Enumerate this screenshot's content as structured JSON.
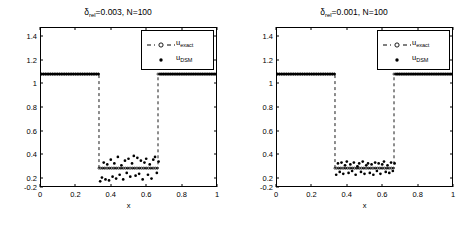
{
  "figure": {
    "background": "#ffffff",
    "axis_color": "#000000",
    "data_color": "#000000"
  },
  "panels": [
    {
      "id": "panel-left",
      "title_prefix": "δ",
      "title_sub": "rel",
      "title_rest": "=0.003, N=100",
      "title_full": "δrel=0.003, N=100"
    },
    {
      "id": "panel-right",
      "title_prefix": "δ",
      "title_sub": "rel",
      "title_rest": "=0.001, N=100",
      "title_full": "δrel=0.001, N=100"
    }
  ],
  "legend": {
    "entries": [
      {
        "label_main": "u",
        "label_sub": "exact",
        "style": "dashed-line-with-circle-marker"
      },
      {
        "label_main": "u",
        "label_sub": "DSM",
        "style": "dot-marker"
      }
    ]
  },
  "axis": {
    "xlabel": "x",
    "ylabel": "",
    "xticks": [
      "0",
      "0.2",
      "0.4",
      "0.6",
      "0.8",
      "1"
    ],
    "xtick_values": [
      0,
      0.2,
      0.4,
      0.6,
      0.8,
      1
    ],
    "yticks": [
      "-0.2",
      "0",
      "0.2",
      "0.4",
      "0.6",
      "0.8",
      "1",
      "1.2",
      "1.4"
    ],
    "ytick_values": [
      -0.2,
      0,
      0.2,
      0.4,
      0.6,
      0.8,
      1,
      1.2,
      1.4
    ],
    "xlim": [
      0,
      1
    ],
    "ylim": [
      -0.2,
      1.5
    ],
    "grid": false
  },
  "chart_data": {
    "type": "scatter",
    "xlabel": "x",
    "ylabel": "",
    "xlim": [
      0,
      1
    ],
    "ylim": [
      -0.2,
      1.5
    ],
    "grid": false,
    "legend_position": "upper right",
    "panels": [
      {
        "title": "δrel=0.003, N=100",
        "noise_level": 0.003,
        "N": 100,
        "series": [
          {
            "name": "u_exact",
            "style": "dashed line with circle markers",
            "description": "Piecewise-constant well: u=1 for x in [0,1/3) and (2/3,1]; u=0 for x in [1/3,2/3]; vertical dashed jumps at x=1/3 and x=2/3",
            "x": [
              0,
              0.3333,
              0.3333,
              0.6667,
              0.6667,
              1
            ],
            "y": [
              1,
              1,
              0,
              0,
              1,
              1
            ]
          },
          {
            "name": "u_DSM",
            "style": "dot markers",
            "description": "Reconstruction: matches 1 on outer intervals, noisy scatter about 0 on inner interval with spread roughly +/-0.15",
            "x": [
              0.01,
              0.02,
              0.03,
              0.04,
              0.05,
              0.06,
              0.07,
              0.08,
              0.09,
              0.1,
              0.11,
              0.12,
              0.13,
              0.14,
              0.15,
              0.16,
              0.17,
              0.18,
              0.19,
              0.2,
              0.21,
              0.22,
              0.23,
              0.24,
              0.25,
              0.26,
              0.27,
              0.28,
              0.29,
              0.3,
              0.31,
              0.32,
              0.33,
              0.34,
              0.35,
              0.36,
              0.37,
              0.38,
              0.39,
              0.4,
              0.41,
              0.42,
              0.43,
              0.44,
              0.45,
              0.46,
              0.47,
              0.48,
              0.49,
              0.5,
              0.51,
              0.52,
              0.53,
              0.54,
              0.55,
              0.56,
              0.57,
              0.58,
              0.59,
              0.6,
              0.61,
              0.62,
              0.63,
              0.64,
              0.65,
              0.66,
              0.67,
              0.68,
              0.69,
              0.7,
              0.71,
              0.72,
              0.73,
              0.74,
              0.75,
              0.76,
              0.77,
              0.78,
              0.79,
              0.8,
              0.81,
              0.82,
              0.83,
              0.84,
              0.85,
              0.86,
              0.87,
              0.88,
              0.89,
              0.9,
              0.91,
              0.92,
              0.93,
              0.94,
              0.95,
              0.96,
              0.97,
              0.98,
              0.99,
              1.0
            ],
            "y": [
              1,
              1,
              1,
              1,
              1,
              1,
              1,
              1,
              1,
              1,
              1,
              1,
              1,
              1,
              1,
              1,
              1,
              1,
              1,
              1,
              1,
              1,
              1,
              1,
              1,
              1,
              1,
              1,
              1,
              1,
              1,
              1,
              1,
              -0.14,
              -0.1,
              0.06,
              -0.12,
              0.04,
              -0.13,
              0.09,
              -0.09,
              0.05,
              -0.11,
              0.12,
              -0.07,
              0.03,
              -0.12,
              0.08,
              -0.05,
              0.1,
              -0.09,
              0.05,
              0.13,
              -0.08,
              0.11,
              -0.06,
              0.08,
              -0.12,
              0.06,
              0.1,
              -0.07,
              0.04,
              -0.11,
              0.09,
              0.12,
              -0.05,
              0.07,
              1,
              1,
              1,
              1,
              1,
              1,
              1,
              1,
              1,
              1,
              1,
              1,
              1,
              1,
              1,
              1,
              1,
              1,
              1,
              1,
              1,
              1,
              1,
              1,
              1,
              1,
              1,
              1,
              1,
              1,
              1,
              1,
              1
            ]
          }
        ]
      },
      {
        "title": "δrel=0.001, N=100",
        "noise_level": 0.001,
        "N": 100,
        "series": [
          {
            "name": "u_exact",
            "style": "dashed line with circle markers",
            "description": "Piecewise-constant well: u=1 for x in [0,1/3) and (2/3,1]; u=0 for x in [1/3,2/3]; vertical dashed jumps at x=1/3 and x=2/3",
            "x": [
              0,
              0.3333,
              0.3333,
              0.6667,
              0.6667,
              1
            ],
            "y": [
              1,
              1,
              0,
              0,
              1,
              1
            ]
          },
          {
            "name": "u_DSM",
            "style": "dot markers",
            "description": "Reconstruction: matches 1 on outer intervals, tighter noisy scatter about 0 on inner interval with spread roughly +/-0.08",
            "x": [
              0.01,
              0.02,
              0.03,
              0.04,
              0.05,
              0.06,
              0.07,
              0.08,
              0.09,
              0.1,
              0.11,
              0.12,
              0.13,
              0.14,
              0.15,
              0.16,
              0.17,
              0.18,
              0.19,
              0.2,
              0.21,
              0.22,
              0.23,
              0.24,
              0.25,
              0.26,
              0.27,
              0.28,
              0.29,
              0.3,
              0.31,
              0.32,
              0.33,
              0.34,
              0.35,
              0.36,
              0.37,
              0.38,
              0.39,
              0.4,
              0.41,
              0.42,
              0.43,
              0.44,
              0.45,
              0.46,
              0.47,
              0.48,
              0.49,
              0.5,
              0.51,
              0.52,
              0.53,
              0.54,
              0.55,
              0.56,
              0.57,
              0.58,
              0.59,
              0.6,
              0.61,
              0.62,
              0.63,
              0.64,
              0.65,
              0.66,
              0.67,
              0.68,
              0.69,
              0.7,
              0.71,
              0.72,
              0.73,
              0.74,
              0.75,
              0.76,
              0.77,
              0.78,
              0.79,
              0.8,
              0.81,
              0.82,
              0.83,
              0.84,
              0.85,
              0.86,
              0.87,
              0.88,
              0.89,
              0.9,
              0.91,
              0.92,
              0.93,
              0.94,
              0.95,
              0.96,
              0.97,
              0.98,
              0.99,
              1.0
            ],
            "y": [
              1,
              1,
              1,
              1,
              1,
              1,
              1,
              1,
              1,
              1,
              1,
              1,
              1,
              1,
              1,
              1,
              1,
              1,
              1,
              1,
              1,
              1,
              1,
              1,
              1,
              1,
              1,
              1,
              1,
              1,
              1,
              1,
              1,
              -0.07,
              0.05,
              -0.04,
              0.06,
              -0.06,
              0.03,
              0.07,
              -0.05,
              0.04,
              -0.03,
              0.06,
              -0.07,
              0.02,
              0.05,
              -0.04,
              0.07,
              -0.06,
              0.03,
              0.05,
              -0.05,
              0.04,
              -0.07,
              0.06,
              -0.03,
              0.05,
              -0.06,
              0.04,
              0.07,
              -0.04,
              0.03,
              -0.05,
              0.06,
              -0.03,
              0.05,
              1,
              1,
              1,
              1,
              1,
              1,
              1,
              1,
              1,
              1,
              1,
              1,
              1,
              1,
              1,
              1,
              1,
              1,
              1,
              1,
              1,
              1,
              1,
              1,
              1,
              1,
              1,
              1,
              1,
              1,
              1,
              1,
              1
            ]
          }
        ]
      }
    ]
  }
}
